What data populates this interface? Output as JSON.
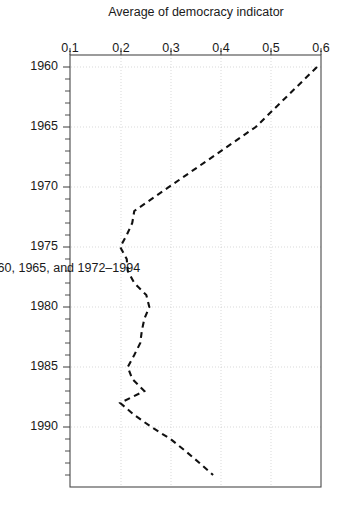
{
  "chart_data": {
    "type": "line",
    "title": "",
    "subtitle": "",
    "xlabel": "Values plotted for 1960, 1965, and 1972–1994",
    "ylabel": "Average of democracy indicator",
    "xlim": [
      1959,
      1995
    ],
    "ylim": [
      0.1,
      0.6
    ],
    "xticks": [
      1960,
      1965,
      1970,
      1975,
      1980,
      1985,
      1990
    ],
    "xticklabels": [
      "1960",
      "1965",
      "1970",
      "1975",
      "1980",
      "1985",
      "1990"
    ],
    "yticks": [
      0.1,
      0.2,
      0.3,
      0.4,
      0.5,
      0.6
    ],
    "yticklabels": [
      "0.1",
      "0.2",
      "0.3",
      "0.4",
      "0.5",
      "0.6"
    ],
    "grid": true,
    "legend": "none",
    "linestyle": "dashed",
    "orientation": "rotated-90-clockwise",
    "x": [
      1960,
      1965,
      1972,
      1973,
      1974,
      1975,
      1976,
      1977,
      1978,
      1979,
      1980,
      1981,
      1982,
      1983,
      1984,
      1985,
      1986,
      1987,
      1988,
      1989,
      1990,
      1991,
      1992,
      1993,
      1994
    ],
    "values": [
      0.592,
      0.47,
      0.228,
      0.224,
      0.213,
      0.2,
      0.213,
      0.215,
      0.228,
      0.252,
      0.258,
      0.248,
      0.243,
      0.24,
      0.228,
      0.215,
      0.224,
      0.248,
      0.2,
      0.228,
      0.262,
      0.3,
      0.33,
      0.358,
      0.385
    ],
    "series": [
      {
        "name": "Average of democracy indicator",
        "values": [
          0.592,
          0.47,
          0.228,
          0.224,
          0.213,
          0.2,
          0.213,
          0.215,
          0.228,
          0.252,
          0.258,
          0.248,
          0.243,
          0.24,
          0.228,
          0.215,
          0.224,
          0.248,
          0.2,
          0.228,
          0.262,
          0.3,
          0.33,
          0.358,
          0.385
        ]
      }
    ],
    "colors": {
      "line": "#111111",
      "frame": "#4a4a4a",
      "grid": "#c9c9c9",
      "background": "#ffffff"
    }
  },
  "axes": {
    "x_title": "Values plotted for 1960, 1965, and 1972–1994",
    "y_title": "Average of democracy indicator",
    "x_tick_1960": "1960",
    "x_tick_1965": "1965",
    "x_tick_1970": "1970",
    "x_tick_1975": "1975",
    "x_tick_1980": "1980",
    "x_tick_1985": "1985",
    "x_tick_1990": "1990",
    "y_tick_01": "0.1",
    "y_tick_02": "0.2",
    "y_tick_03": "0.3",
    "y_tick_04": "0.4",
    "y_tick_05": "0.5",
    "y_tick_06": "0.6"
  }
}
